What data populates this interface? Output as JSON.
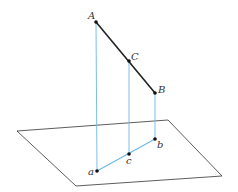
{
  "diagram": {
    "title": "",
    "colors": {
      "segment": "#222222",
      "projection": "#6db8e6",
      "plane": "#333333",
      "point": "#111111"
    },
    "plane": {
      "corners": [
        [
          17,
          131
        ],
        [
          168,
          120
        ],
        [
          222,
          176
        ],
        [
          76,
          186
        ]
      ]
    },
    "points": [
      {
        "id": "A",
        "label": "A",
        "x": 96,
        "y": 22,
        "lx": 88,
        "ly": 19
      },
      {
        "id": "C",
        "label": "C",
        "x": 129,
        "y": 61,
        "lx": 131,
        "ly": 60
      },
      {
        "id": "B",
        "label": "B",
        "x": 155,
        "y": 93,
        "lx": 158,
        "ly": 93
      },
      {
        "id": "a",
        "label": "a",
        "x": 97,
        "y": 171,
        "lx": 88,
        "ly": 175
      },
      {
        "id": "c",
        "label": "c",
        "x": 129,
        "y": 154,
        "lx": 126,
        "ly": 164
      },
      {
        "id": "b",
        "label": "b",
        "x": 155,
        "y": 139,
        "lx": 157,
        "ly": 148
      }
    ],
    "segments": [
      {
        "from": "A",
        "to": "B",
        "type": "segment"
      },
      {
        "from": "A",
        "to": "a",
        "type": "projection"
      },
      {
        "from": "C",
        "to": "c",
        "type": "projection"
      },
      {
        "from": "B",
        "to": "b",
        "type": "projection"
      },
      {
        "from": "a",
        "to": "b",
        "type": "projection"
      }
    ]
  }
}
